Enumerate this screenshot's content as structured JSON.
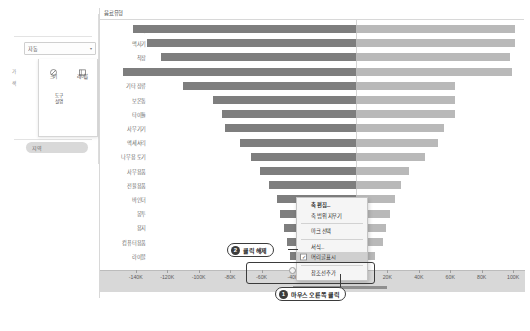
{
  "app": {
    "title": "Tableau",
    "background": "#ffffff"
  },
  "left_panel": {
    "dropdown": {
      "value": "자동",
      "caret": "▾"
    },
    "tool_buttons": [
      {
        "label": "크기",
        "icon": "size-circle-icon"
      },
      {
        "label": "레이블",
        "icon": "label-box-icon"
      }
    ],
    "secondary": {
      "line1": "도구",
      "line2": "설명"
    },
    "side_ticks": [
      "가",
      "색"
    ],
    "pill": {
      "label": "지역"
    }
  },
  "viz": {
    "header_title": "음료유형",
    "axis": {
      "tick_labels": [
        "-140K",
        "-120K",
        "-100K",
        "-80K",
        "-60K",
        "-40K",
        "-20K",
        "0K",
        "20K",
        "40K",
        "60K",
        "80K",
        "100K"
      ],
      "tick_values": [
        -140000,
        -120000,
        -100000,
        -80000,
        -60000,
        -40000,
        -20000,
        0,
        20000,
        40000,
        60000,
        80000,
        100000
      ],
      "hidden_label_indices": [
        6,
        7
      ]
    }
  },
  "chart_data": {
    "type": "bar",
    "title": "음료유형",
    "xlabel": "",
    "ylabel": "음료유형",
    "xlim": [
      -150000,
      105000
    ],
    "grid": false,
    "legend": "none",
    "orientation": "horizontal",
    "style": "diverging-butterfly",
    "colors": {
      "negative": "#7e7e7e",
      "positive": "#b9b9b9"
    },
    "categories": [
      "도가",
      "맥사기",
      "착장",
      "건조기",
      "기타 장류",
      "보온통",
      "타이틀",
      "사무기기",
      "액세서리",
      "나무용 토기",
      "사무용품",
      "전율용품",
      "바인더",
      "봉투",
      "용지",
      "컴퓨터용품",
      "라이블"
    ],
    "series": [
      {
        "name": "음수 (좌)",
        "color": "#7e7e7e",
        "values": [
          -142000,
          -133000,
          -124000,
          -148000,
          -110000,
          -91000,
          -85000,
          -83000,
          -74000,
          -67000,
          -61000,
          -55000,
          -50000,
          -48000,
          -46000,
          -44000,
          -42000
        ]
      },
      {
        "name": "양수 (우)",
        "color": "#b9b9b9",
        "values": [
          101000,
          101000,
          98000,
          99000,
          63000,
          63000,
          63000,
          56000,
          52000,
          44000,
          34000,
          29000,
          25000,
          22000,
          19000,
          17000,
          12000
        ]
      }
    ]
  },
  "context_menu": {
    "items": [
      {
        "label": "축 편집...",
        "bold": true,
        "checked": false,
        "highlighted": false
      },
      {
        "label": "축 범위 지우기",
        "bold": false,
        "checked": false,
        "highlighted": false
      },
      {
        "label": "마크 선택",
        "bold": false,
        "checked": false,
        "highlighted": false
      },
      {
        "label": "서식...",
        "bold": false,
        "checked": false,
        "highlighted": false
      },
      {
        "label": "머리글 표시",
        "bold": false,
        "checked": true,
        "highlighted": true
      },
      {
        "label": "참조선 추가",
        "bold": false,
        "checked": false,
        "highlighted": false
      }
    ],
    "check_glyph": "✓"
  },
  "callouts": [
    {
      "id": 1,
      "number": "1",
      "text": "마우스 오른쪽 클릭"
    },
    {
      "id": 2,
      "number": "2",
      "text": "클릭 해제"
    }
  ]
}
